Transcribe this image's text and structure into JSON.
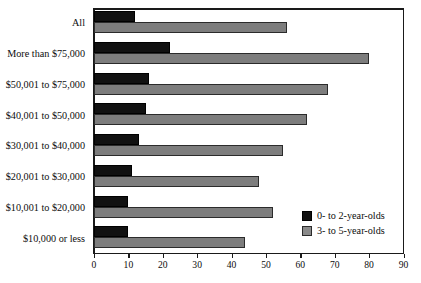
{
  "chart_data": {
    "type": "bar",
    "orientation": "horizontal",
    "title": "",
    "subtitle": "",
    "xlabel": "",
    "ylabel": "",
    "xlim": [
      0,
      90
    ],
    "xticks": [
      0,
      10,
      20,
      30,
      40,
      50,
      60,
      70,
      80,
      90
    ],
    "xtick_labels": [
      "0",
      "10",
      "20",
      "30",
      "40",
      "50",
      "60",
      "70",
      "80",
      "90"
    ],
    "grid": false,
    "legend_position": "bottom-right",
    "categories": [
      "All",
      "More than $75,000",
      "$50,001 to $75,000",
      "$40,001 to $50,000",
      "$30,001 to $40,000",
      "$20,001 to $30,000",
      "$10,001 to $20,000",
      "$10,000 or less"
    ],
    "series": [
      {
        "name": "0- to 2-year-olds",
        "color": "#111111",
        "values": [
          12,
          22,
          16,
          15,
          13,
          11,
          10,
          10
        ]
      },
      {
        "name": "3- to 5-year-olds",
        "color": "#7d7d7d",
        "values": [
          56,
          80,
          68,
          62,
          55,
          48,
          52,
          44
        ]
      }
    ]
  },
  "legend": {
    "items": [
      {
        "label": "0- to 2-year-olds",
        "color": "#111111"
      },
      {
        "label": "3- to 5-year-olds",
        "color": "#8a8a8a"
      }
    ]
  }
}
